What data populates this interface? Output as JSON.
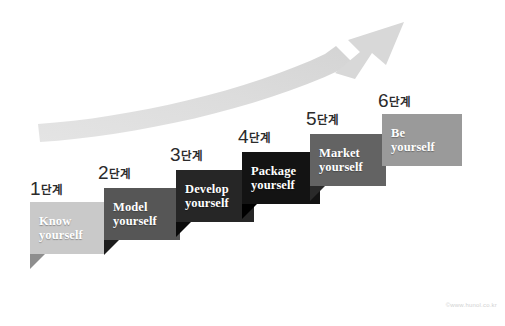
{
  "diagram": {
    "title_text": "",
    "background_color": "#ffffff",
    "arrow": {
      "name": "growth-arrow",
      "color": "#dedede",
      "direction": "up-right"
    },
    "watermark": "©www.hunol.co.kr",
    "steps": [
      {
        "number": "1",
        "unit": "단계",
        "label": "Know\nyourself",
        "color": "#c9c9c9",
        "fold_color": "#8e8e8e",
        "text_color": "#ffffff",
        "x": 30,
        "y": 202,
        "w": 74,
        "h": 52,
        "caption_x": 30,
        "caption_y": 178,
        "fold_size": 15
      },
      {
        "number": "2",
        "unit": "단계",
        "label": "Model\nyourself",
        "color": "#565656",
        "fold_color": "#1c1c1c",
        "text_color": "#ffffff",
        "x": 104,
        "y": 188,
        "w": 76,
        "h": 52,
        "caption_x": 98,
        "caption_y": 162,
        "fold_size": 15
      },
      {
        "number": "3",
        "unit": "단계",
        "label": "Develop\nyourself",
        "color": "#262626",
        "fold_color": "#0b0b0b",
        "text_color": "#ffffff",
        "x": 176,
        "y": 170,
        "w": 78,
        "h": 52,
        "caption_x": 170,
        "caption_y": 144,
        "fold_size": 15
      },
      {
        "number": "4",
        "unit": "단계",
        "label": "Package\nyourself",
        "color": "#131313",
        "fold_color": "#000000",
        "text_color": "#ffffff",
        "x": 242,
        "y": 152,
        "w": 78,
        "h": 52,
        "caption_x": 238,
        "caption_y": 126,
        "fold_size": 15
      },
      {
        "number": "5",
        "unit": "단계",
        "label": "Market\nyourself",
        "color": "#636363",
        "fold_color": "#2a2a2a",
        "text_color": "#ffffff",
        "x": 310,
        "y": 134,
        "w": 76,
        "h": 52,
        "caption_x": 306,
        "caption_y": 108,
        "fold_size": 15
      },
      {
        "number": "6",
        "unit": "단계",
        "label": "Be\nyourself",
        "color": "#9a9a9a",
        "fold_color": "#6a6a6a",
        "text_color": "#ffffff",
        "x": 382,
        "y": 114,
        "w": 80,
        "h": 52,
        "caption_x": 378,
        "caption_y": 90,
        "fold_size": 0
      }
    ]
  }
}
